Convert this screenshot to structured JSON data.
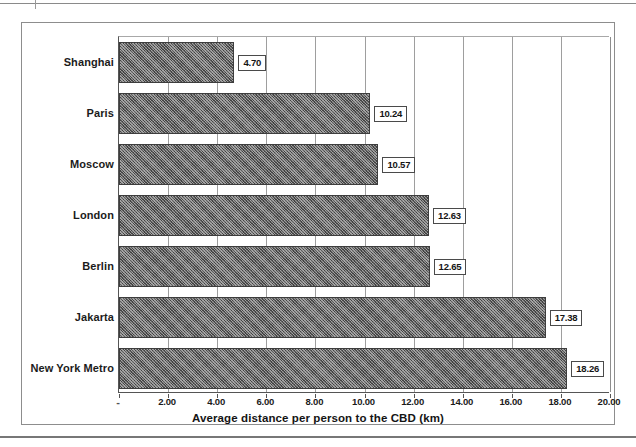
{
  "chart_data": {
    "type": "bar",
    "orientation": "horizontal",
    "title": "",
    "xlabel": "Average distance per person to the CBD (km)",
    "ylabel": "",
    "categories": [
      "Shanghai",
      "Paris",
      "Moscow",
      "London",
      "Berlin",
      "Jakarta",
      "New York Metro"
    ],
    "values": [
      4.7,
      10.24,
      10.57,
      12.63,
      12.65,
      17.38,
      18.26
    ],
    "value_labels": [
      "4.70",
      "10.24",
      "10.57",
      "12.63",
      "12.65",
      "17.38",
      "18.26"
    ],
    "xlim": [
      0,
      20
    ],
    "xticks": [
      0,
      2,
      4,
      6,
      8,
      10,
      12,
      14,
      16,
      18,
      20
    ],
    "xtick_labels": [
      "-",
      "2.00",
      "4.00",
      "6.00",
      "8.00",
      "10.00",
      "12.00",
      "14.00",
      "16.00",
      "18.00",
      "20.00"
    ],
    "grid": "vertical",
    "legend": "none",
    "series": [
      {
        "name": "Average distance per person to the CBD (km)",
        "values": [
          4.7,
          10.24,
          10.57,
          12.63,
          12.65,
          17.38,
          18.26
        ]
      }
    ],
    "colors": {
      "bar_fill": "#5e5e5e",
      "bar_border": "#3d3d3d",
      "gridline": "#9e9e9e",
      "axis": "#555555",
      "frame": "#8d8d8d",
      "label_box_border": "#4a4a4a",
      "label_box_fill": "#ffffff",
      "text": "#1a1a1a",
      "background": "#ffffff"
    }
  }
}
